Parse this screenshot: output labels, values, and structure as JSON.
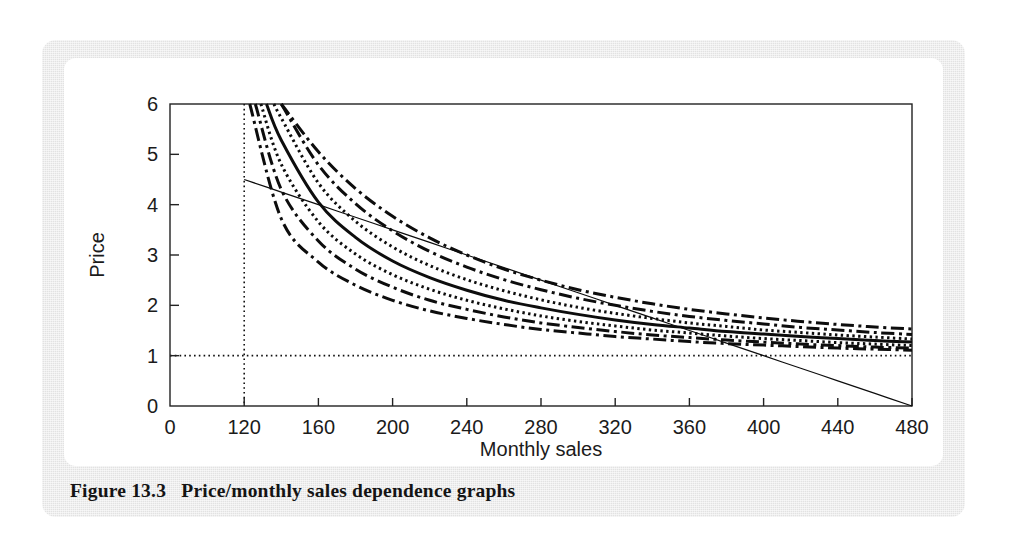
{
  "figure": {
    "caption_number": "Figure 13.3",
    "caption_text": "Price/monthly sales dependence graphs",
    "caption_full": "Figure 13.3   Price/monthly sales dependence graphs"
  },
  "colors": {
    "panel_background": "#e2e2e2",
    "card_background": "#ffffff",
    "ink": "#111111",
    "axis": "#222222"
  },
  "chart_data": {
    "type": "line",
    "title": "Price/monthly sales dependence graphs",
    "xlabel": "Monthly sales",
    "ylabel": "Price",
    "xlim": [
      80,
      480
    ],
    "ylim": [
      0,
      6
    ],
    "grid": false,
    "legend_position": "none",
    "xticks": [
      80,
      120,
      160,
      200,
      240,
      280,
      320,
      360,
      400,
      440,
      480
    ],
    "xticklabels": [
      "0",
      "120",
      "160",
      "200",
      "240",
      "280",
      "320",
      "360",
      "400",
      "440",
      "480"
    ],
    "yticks": [
      0,
      1,
      2,
      3,
      4,
      5,
      6
    ],
    "yticklabels": [
      "0",
      "1",
      "2",
      "3",
      "4",
      "5",
      "6"
    ],
    "reference_lines": [
      {
        "name": "vertical-reference",
        "orientation": "vertical",
        "value": 120,
        "style": "dotted"
      },
      {
        "name": "horizontal-reference",
        "orientation": "horizontal",
        "value": 1,
        "style": "dotted"
      }
    ],
    "x": [
      120,
      140,
      160,
      180,
      200,
      220,
      240,
      260,
      280,
      300,
      320,
      340,
      360,
      380,
      400,
      420,
      440,
      460,
      480
    ],
    "series": [
      {
        "name": "curve-1-upper-dashdot",
        "style": "dashdot",
        "x_start": 148,
        "values": [
          null,
          6.0,
          5.05,
          4.32,
          3.77,
          3.34,
          3.0,
          2.72,
          2.5,
          2.31,
          2.16,
          2.03,
          1.92,
          1.83,
          1.75,
          1.68,
          1.62,
          1.57,
          1.53
        ]
      },
      {
        "name": "curve-2-dashdot",
        "style": "dashdot",
        "x_start": 141,
        "values": [
          null,
          6.0,
          4.79,
          4.02,
          3.48,
          3.07,
          2.76,
          2.51,
          2.31,
          2.14,
          2.0,
          1.88,
          1.78,
          1.7,
          1.63,
          1.56,
          1.51,
          1.46,
          1.42
        ]
      },
      {
        "name": "curve-3-dotted",
        "style": "dotted",
        "x_start": 136,
        "values": [
          null,
          5.72,
          4.43,
          3.67,
          3.16,
          2.79,
          2.51,
          2.29,
          2.11,
          1.96,
          1.84,
          1.74,
          1.65,
          1.58,
          1.51,
          1.46,
          1.41,
          1.37,
          1.33
        ]
      },
      {
        "name": "curve-4-solid",
        "style": "solid",
        "x_start": 132,
        "values": [
          null,
          5.28,
          4.05,
          3.35,
          2.88,
          2.55,
          2.3,
          2.1,
          1.95,
          1.82,
          1.71,
          1.62,
          1.55,
          1.48,
          1.43,
          1.38,
          1.34,
          1.3,
          1.27
        ]
      },
      {
        "name": "curve-5-dotted",
        "style": "dotted",
        "x_start": 129,
        "values": [
          null,
          4.8,
          3.66,
          3.02,
          2.61,
          2.32,
          2.1,
          1.93,
          1.79,
          1.68,
          1.59,
          1.51,
          1.45,
          1.39,
          1.34,
          1.3,
          1.26,
          1.23,
          1.2
        ]
      },
      {
        "name": "curve-6-dashdot",
        "style": "dashdot",
        "x_start": 126,
        "values": [
          null,
          4.3,
          3.28,
          2.72,
          2.36,
          2.1,
          1.92,
          1.77,
          1.65,
          1.56,
          1.48,
          1.41,
          1.36,
          1.31,
          1.27,
          1.23,
          1.2,
          1.17,
          1.15
        ]
      },
      {
        "name": "curve-7-lower-dashdot",
        "style": "dashdot",
        "x_start": 123,
        "values": [
          null,
          3.72,
          2.86,
          2.4,
          2.1,
          1.89,
          1.74,
          1.62,
          1.52,
          1.45,
          1.38,
          1.33,
          1.28,
          1.24,
          1.21,
          1.18,
          1.15,
          1.13,
          1.11
        ]
      },
      {
        "name": "straight-line",
        "style": "solid-thin",
        "x_start": 120,
        "values": [
          4.5,
          4.25,
          4.0,
          3.75,
          3.5,
          3.25,
          3.0,
          2.75,
          2.5,
          2.25,
          2.0,
          1.75,
          1.5,
          1.25,
          1.0,
          0.75,
          0.5,
          0.25,
          0.0
        ]
      }
    ]
  }
}
